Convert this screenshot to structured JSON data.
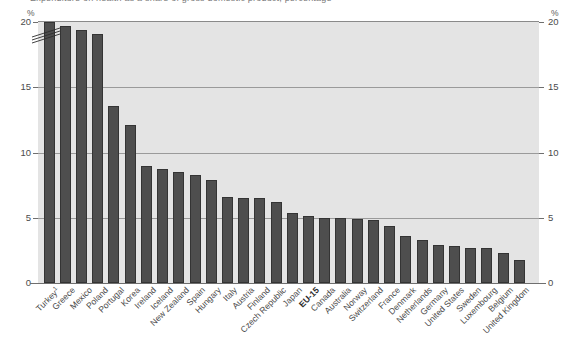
{
  "figure": {
    "title_clipped": "Expenditure on health as a share of gross domestic product, percentage",
    "axis_unit_left": "%",
    "axis_unit_right": "%"
  },
  "axis": {
    "y_ticks": [
      "20",
      "15",
      "10",
      "5",
      "0"
    ],
    "y_tick_values": [
      20,
      15,
      10,
      5,
      0
    ],
    "y_min": 0,
    "y_max": 20,
    "break_note": "axis break on first bar (Turkey exceeds 20)"
  },
  "colors": {
    "bar_fill": "#4e4e4e",
    "bar_stroke": "#343434",
    "plot_background": "#e4e4e4",
    "gridline": "#9a9a9a",
    "page_background": "#ffffff",
    "text": "#4b4b4b"
  },
  "chart_data": {
    "type": "bar",
    "title": "Expenditure on health as a share of gross domestic product, percentage",
    "xlabel": "",
    "ylabel": "%",
    "ylim": [
      0,
      20
    ],
    "grid": true,
    "legend": "none",
    "categories": [
      "Turkey¹",
      "Greece",
      "Mexico",
      "Poland",
      "Portugal",
      "Korea",
      "Ireland",
      "Iceland",
      "New Zealand",
      "Spain",
      "Hungary",
      "Italy",
      "Austria",
      "Finland",
      "Czech Republic",
      "Japan",
      "EU-15",
      "Canada",
      "Australia",
      "Norway",
      "Switzerland",
      "France",
      "Denmark",
      "Netherlands",
      "Germany",
      "United States",
      "Sweden",
      "Luxembourg",
      "Belgium",
      "United Kingdom"
    ],
    "values": [
      20.0,
      19.7,
      19.4,
      19.1,
      13.6,
      12.1,
      9.0,
      8.7,
      8.5,
      8.3,
      7.9,
      6.6,
      6.5,
      6.5,
      6.2,
      5.4,
      5.1,
      5.0,
      5.0,
      4.9,
      4.8,
      4.4,
      3.6,
      3.3,
      2.9,
      2.8,
      2.7,
      2.7,
      2.3,
      1.8
    ],
    "highlighted_category": "EU-15",
    "footnote_marker": "1"
  }
}
